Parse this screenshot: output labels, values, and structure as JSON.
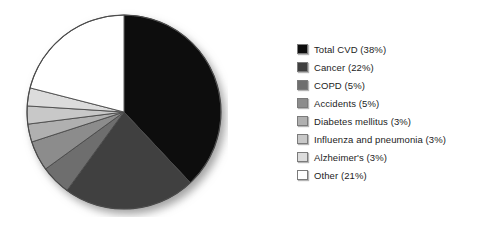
{
  "chart_data": {
    "type": "pie",
    "title": "",
    "subtitle": "",
    "xlabel": "",
    "ylabel": "",
    "grid": false,
    "legend_position": "right",
    "start_angle_deg": 0,
    "direction": "clockwise",
    "units": "percent",
    "categories": [
      "Total CVD",
      "Cancer",
      "COPD",
      "Accidents",
      "Diabetes mellitus",
      "Influenza and pneumonia",
      "Alzheimer's",
      "Other"
    ],
    "values": [
      38,
      22,
      5,
      5,
      3,
      3,
      3,
      21
    ],
    "slice_colors": [
      "#0d0d0d",
      "#3f3f3f",
      "#6e6e6e",
      "#8c8c8c",
      "#b0b0b0",
      "#c8c8c8",
      "#dcdcdc",
      "#ffffff"
    ],
    "slice_edge_color": "#4a4a4a",
    "labels_with_values": [
      "Total CVD (38%)",
      "Cancer (22%)",
      "COPD (5%)",
      "Accidents (5%)",
      "Diabetes mellitus (3%)",
      "Influenza and pneumonia (3%)",
      "Alzheimer's (3%)",
      "Other (21%)"
    ]
  },
  "legend": {
    "items": [
      {
        "label": "Total CVD (38%)",
        "swatch": "#0d0d0d"
      },
      {
        "label": "Cancer (22%)",
        "swatch": "#3f3f3f"
      },
      {
        "label": "COPD (5%)",
        "swatch": "#6e6e6e"
      },
      {
        "label": "Accidents (5%)",
        "swatch": "#8c8c8c"
      },
      {
        "label": "Diabetes mellitus (3%)",
        "swatch": "#b0b0b0"
      },
      {
        "label": "Influenza and pneumonia (3%)",
        "swatch": "#c8c8c8"
      },
      {
        "label": "Alzheimer's (3%)",
        "swatch": "#dcdcdc"
      },
      {
        "label": "Other (21%)",
        "swatch": "#ffffff"
      }
    ]
  },
  "pie_geometry": {
    "cx": 102,
    "cy": 103,
    "r": 97,
    "shadow_dx": 4,
    "shadow_dy": 5,
    "shadow_blur": 5,
    "shadow_color": "#9a9a9a"
  },
  "canvas": {
    "background": "#ffffff",
    "width": 481,
    "height": 235
  }
}
